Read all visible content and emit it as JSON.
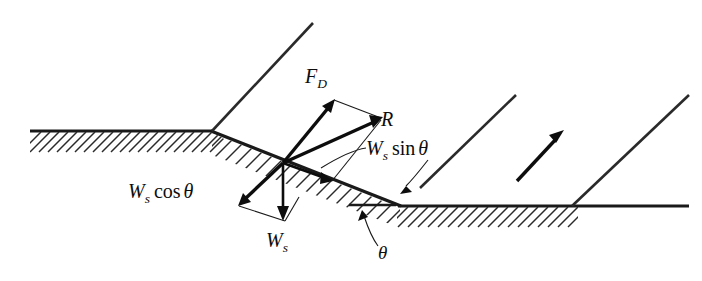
{
  "figure": {
    "kind": "free-body-diagram",
    "background_color": "#ffffff",
    "ink_color": "#0d0d0d"
  },
  "labels": {
    "drag_force": {
      "symbol": "F",
      "subscript": "D",
      "text": "F_D"
    },
    "resultant": {
      "symbol": "R",
      "subscript": "",
      "text": "R"
    },
    "weight_parallel": {
      "symbol": "W",
      "subscript": "s",
      "operator": "sin",
      "angle": "θ",
      "text": "W_s sin θ"
    },
    "weight_normal": {
      "symbol": "W",
      "subscript": "s",
      "operator": "cos",
      "angle": "θ",
      "text": "W_s cos θ"
    },
    "weight": {
      "symbol": "W",
      "subscript": "s",
      "text": "W_s"
    },
    "slope_angle": {
      "symbol": "θ",
      "text": "θ"
    }
  },
  "geometry": {
    "origin": {
      "x": 283,
      "y": 163
    },
    "upper_ground": {
      "x1": 30,
      "y1": 131,
      "x2": 212,
      "y2": 131
    },
    "lower_ground": {
      "x1": 397,
      "y1": 206,
      "x2": 688,
      "y2": 206
    },
    "slope": {
      "x1": 212,
      "y1": 131,
      "x2": 400,
      "y2": 206
    },
    "bank_lines": [
      {
        "x1": 212,
        "y1": 131,
        "x2": 313,
        "y2": 23
      },
      {
        "x1": 400,
        "y1": 206,
        "x2": 515,
        "y2": 95
      },
      {
        "x1": 572,
        "y1": 206,
        "x2": 688,
        "y2": 95
      }
    ],
    "reference_line": {
      "x1": 348,
      "y1": 205,
      "x2": 395,
      "y2": 205
    }
  },
  "vectors": [
    {
      "name": "drag-force",
      "label": "F_D",
      "from": {
        "x": 283,
        "y": 163
      },
      "to": {
        "x": 332,
        "y": 103
      }
    },
    {
      "name": "resultant",
      "label": "R",
      "from": {
        "x": 283,
        "y": 163
      },
      "to": {
        "x": 380,
        "y": 119
      }
    },
    {
      "name": "weight-parallel",
      "label": "W_s sin θ",
      "from": {
        "x": 283,
        "y": 163
      },
      "to": {
        "x": 330,
        "y": 180
      }
    },
    {
      "name": "weight-normal",
      "label": "W_s cos θ",
      "from": {
        "x": 283,
        "y": 163
      },
      "to": {
        "x": 240,
        "y": 204
      }
    },
    {
      "name": "weight",
      "label": "W_s",
      "from": {
        "x": 283,
        "y": 163
      },
      "to": {
        "x": 283,
        "y": 219
      }
    },
    {
      "name": "flow-direction",
      "label": "",
      "from": {
        "x": 517,
        "y": 181
      },
      "to": {
        "x": 563,
        "y": 131
      }
    }
  ],
  "hatching": {
    "angle_description": "45-degree lines descending to the left",
    "upper_band_x_start": 33,
    "upper_band_x_end": 212,
    "lower_band_x_start": 399,
    "lower_band_x_end": 578,
    "spacing": 9.5
  }
}
